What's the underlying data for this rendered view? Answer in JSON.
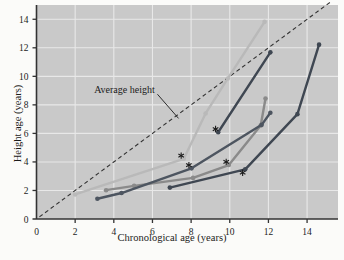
{
  "chart_data": {
    "type": "line",
    "title": "",
    "xlabel": "Chronological age (years)",
    "ylabel": "Height age (years)",
    "xlim": [
      0,
      15.6
    ],
    "ylim": [
      0,
      15.0
    ],
    "xticks": [
      0,
      2,
      4,
      6,
      8,
      10,
      12,
      14
    ],
    "yticks": [
      0,
      2,
      4,
      6,
      8,
      10,
      12,
      14
    ],
    "grid": true,
    "legend": "none",
    "annotations": [
      {
        "name": "average-height-label",
        "text": "Average height",
        "x": 4.55,
        "y": 8.85,
        "leader_to_x": 7.35,
        "leader_to_y": 7.05
      }
    ],
    "reference_line": {
      "name": "average-height-reference",
      "style": "dashed",
      "color": "#333333",
      "from": [
        0.15,
        0.15
      ],
      "to": [
        15.2,
        15.2
      ]
    },
    "series": [
      {
        "name": "patient-1",
        "color": "#b9b9b9",
        "points": [
          {
            "x": 2.0,
            "y": 1.72
          },
          {
            "x": 7.62,
            "y": 4.22
          },
          {
            "x": 8.75,
            "y": 7.4
          },
          {
            "x": 9.9,
            "y": 9.85
          },
          {
            "x": 11.8,
            "y": 13.82
          }
        ],
        "treatment_marker": {
          "x": 7.62,
          "y": 4.22
        }
      },
      {
        "name": "patient-2",
        "color": "#8a8a8a",
        "points": [
          {
            "x": 3.6,
            "y": 2.02
          },
          {
            "x": 5.05,
            "y": 2.32
          },
          {
            "x": 8.1,
            "y": 2.88
          },
          {
            "x": 9.95,
            "y": 3.78
          },
          {
            "x": 11.6,
            "y": 6.55
          },
          {
            "x": 11.85,
            "y": 8.45
          }
        ],
        "treatment_marker": {
          "x": 9.95,
          "y": 3.78
        }
      },
      {
        "name": "patient-3",
        "color": "#4d5560",
        "points": [
          {
            "x": 3.15,
            "y": 1.42
          },
          {
            "x": 4.4,
            "y": 1.82
          },
          {
            "x": 8.02,
            "y": 3.55
          },
          {
            "x": 11.65,
            "y": 6.6
          },
          {
            "x": 12.1,
            "y": 7.45
          }
        ],
        "treatment_marker": {
          "x": 8.02,
          "y": 3.55
        }
      },
      {
        "name": "patient-4",
        "color": "#3f4752",
        "points": [
          {
            "x": 9.4,
            "y": 6.08
          },
          {
            "x": 12.1,
            "y": 11.68
          }
        ],
        "treatment_marker": {
          "x": 9.4,
          "y": 6.08
        }
      },
      {
        "name": "patient-5",
        "color": "#3f4752",
        "points": [
          {
            "x": 6.9,
            "y": 2.2
          },
          {
            "x": 10.8,
            "y": 3.48
          },
          {
            "x": 13.5,
            "y": 7.35
          },
          {
            "x": 14.62,
            "y": 12.22
          }
        ],
        "treatment_marker": {
          "x": 10.8,
          "y": 3.02
        }
      }
    ]
  },
  "axes": {
    "x_tick_labels": [
      "0",
      "2",
      "4",
      "6",
      "8",
      "10",
      "12",
      "14"
    ],
    "y_tick_labels": [
      "0",
      "2",
      "4",
      "6",
      "8",
      "10",
      "12",
      "14"
    ],
    "x_axis_title": "Chronological age (years)",
    "y_axis_title": "Height age (years)"
  },
  "style": {
    "plot_background": "#c9c9c9",
    "page_background": "#fbfbf9",
    "grid_color": "#e8e8e8",
    "axis_color": "#333333",
    "text_color": "#1b1b1b"
  }
}
